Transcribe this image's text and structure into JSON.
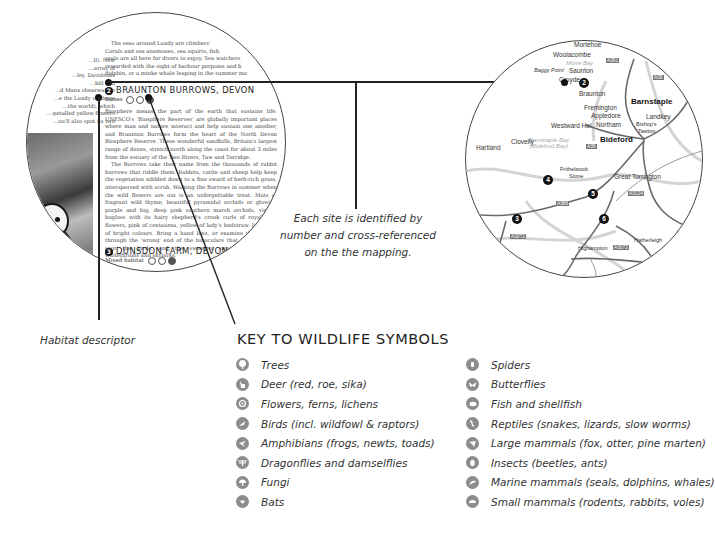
{
  "excerpt": {
    "top_paragraph": [
      "The seas around Lundy are climbers'",
      "Corals and sea anemones, sea squirts, fish",
      "seals are all here for divers to enjoy. Sea watchers",
      "rewarded with the sight of harbour porpoise and b",
      "dolphin, or a minke whale leaping in the summer mo"
    ],
    "left_column": [
      "...ll). New",
      "...array of",
      "...ley. Davidsons",
      "...bill and",
      "...d Manx shearwaters",
      "...e the Lundy cabbage",
      "...the world), which",
      "...-petalled yellow flowers",
      "...ou'll also spot its two"
    ],
    "site_2": {
      "number": "2",
      "title": "BRAUNTON BURROWS, DEVON",
      "habitat": "Dunes",
      "paragraphs": [
        "Biosphere means the part of the earth that sustains life. UNESCO's 'Biosphere Reserves' are globally important places where man and nature interact and help sustain one another, and Braunton Burrows form the heart of the North Devon Biosphere Reserve. These wonderful sandhills, Britain's largest range of dunes, stretch north along the coast for about 3 miles from the estuary of the Two Rivers, Taw and Torridge.",
        "The Burrows take their name from the thousands of rabbit burrows that riddle them. Rabbits, cattle and sheep help keep the vegetation nibbled down to a fine sward of herb-rich grass, interspersed with scrub. Walking the Burrows in summer when the wild flowers are out is an unforgettable treat. Mats of fragrant wild thyme, beautiful pyramidal orchids or glowing purple and big, deep pink southern marsh orchids, viper's bugloss with its hairy shepherd's crook curls of royal blue flowers, pink of centaurea, yellow of lady's bedstraw. It's a riot of bright colours. Bring a hand lens, or examine the flowers through the 'wrong' end of the binoculars that will help you spot the birds, and the sweetest songs - blackcaps, whitethroats and skylarks."
      ]
    },
    "site_3": {
      "number": "3",
      "title": "DUNSDON FARM, DEVON",
      "habitat": "Mixed habitat"
    }
  },
  "callouts": {
    "site_caption": [
      "Each site is identified by",
      "number and cross-referenced",
      "on the the mapping."
    ],
    "habitat_caption": "Habitat descriptor"
  },
  "map": {
    "places": [
      {
        "name": "Mortehoe",
        "x": 107,
        "y": 42
      },
      {
        "name": "Woolacombe",
        "x": 100,
        "y": 53
      },
      {
        "name": "Morte Bay",
        "x": 105,
        "y": 61,
        "style": "sea"
      },
      {
        "name": "Baggy Point",
        "x": 85,
        "y": 69
      },
      {
        "name": "Saunton",
        "x": 116,
        "y": 68
      },
      {
        "name": "Croyde",
        "x": 102,
        "y": 76
      },
      {
        "name": "Braunton",
        "x": 118,
        "y": 90
      },
      {
        "name": "Barnstaple",
        "x": 178,
        "y": 98,
        "style": "bold"
      },
      {
        "name": "Fremington",
        "x": 126,
        "y": 103
      },
      {
        "name": "Appledore",
        "x": 133,
        "y": 112
      },
      {
        "name": "Landkey",
        "x": 198,
        "y": 114
      },
      {
        "name": "Bishop's",
        "x": 183,
        "y": 118
      },
      {
        "name": "Tawton",
        "x": 184,
        "y": 125
      },
      {
        "name": "Northam",
        "x": 138,
        "y": 121
      },
      {
        "name": "Westward Ho!",
        "x": 96,
        "y": 122
      },
      {
        "name": "Bideford",
        "x": 132,
        "y": 136,
        "style": "bold"
      },
      {
        "name": "Clovelly",
        "x": 54,
        "y": 138
      },
      {
        "name": "Hartland",
        "x": 22,
        "y": 143
      },
      {
        "name": "Frithelstock",
        "x": 99,
        "y": 167
      },
      {
        "name": "Stone",
        "x": 107,
        "y": 174
      },
      {
        "name": "Great Torrington",
        "x": 150,
        "y": 173
      },
      {
        "name": "Highampton",
        "x": 112,
        "y": 245
      },
      {
        "name": "Hatherleigh",
        "x": 172,
        "y": 238
      }
    ],
    "sea_label": [
      "Barnstaple Bay",
      "(Bideford Bay)"
    ],
    "sites": [
      {
        "number": "2",
        "x": 118,
        "y": 80
      },
      {
        "number": "4",
        "x": 82,
        "y": 178
      },
      {
        "number": "5",
        "x": 128,
        "y": 193
      },
      {
        "number": "3",
        "x": 51,
        "y": 218
      },
      {
        "number": "6",
        "x": 138,
        "y": 218
      }
    ],
    "roads": [
      {
        "label": "A361",
        "x": 148,
        "y": 58
      },
      {
        "label": "A39",
        "x": 191,
        "y": 71
      },
      {
        "label": "A39",
        "x": 128,
        "y": 143
      },
      {
        "label": "A386",
        "x": 143,
        "y": 185
      },
      {
        "label": "A3124",
        "x": 164,
        "y": 192
      },
      {
        "label": "A3072",
        "x": 50,
        "y": 236
      },
      {
        "label": "A3072",
        "x": 148,
        "y": 245
      }
    ]
  },
  "key": {
    "title": "KEY TO WILDLIFE SYMBOLS",
    "left": [
      {
        "icon": "tree-icon",
        "label": "Trees"
      },
      {
        "icon": "deer-icon",
        "label": "Deer (red, roe, sika)"
      },
      {
        "icon": "flower-icon",
        "label": "Flowers, ferns, lichens"
      },
      {
        "icon": "bird-icon",
        "label": "Birds (incl. wildfowl & raptors)"
      },
      {
        "icon": "amphibian-icon",
        "label": "Amphibians (frogs, newts, toads)"
      },
      {
        "icon": "dragonfly-icon",
        "label": "Dragonflies and damselflies"
      },
      {
        "icon": "fungi-icon",
        "label": "Fungi"
      },
      {
        "icon": "bat-icon",
        "label": "Bats"
      }
    ],
    "right": [
      {
        "icon": "spider-icon",
        "label": "Spiders"
      },
      {
        "icon": "butterfly-icon",
        "label": "Butterflies"
      },
      {
        "icon": "fish-icon",
        "label": "Fish and shellfish"
      },
      {
        "icon": "reptile-icon",
        "label": "Reptiles (snakes, lizards, slow worms)"
      },
      {
        "icon": "large-mammal-icon",
        "label": "Large mammals (fox, otter, pine marten)"
      },
      {
        "icon": "insect-icon",
        "label": "Insects (beetles, ants)"
      },
      {
        "icon": "marine-mammal-icon",
        "label": "Marine mammals (seals, dolphins, whales)"
      },
      {
        "icon": "small-mammal-icon",
        "label": "Small mammals (rodents, rabbits, voles)"
      }
    ]
  }
}
